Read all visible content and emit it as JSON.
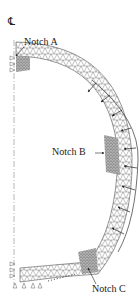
{
  "figure": {
    "centerline_symbol": "CL",
    "centerline_label": "℄",
    "labels": {
      "notch_a": "Notch A",
      "notch_b": "Notch B",
      "notch_c": "Notch C"
    },
    "elements": {
      "mesh": "triangular finite-element mesh of curved arch segment",
      "load": "distributed pressure arrows on outer radius",
      "supports": "roller supports along symmetry edges"
    },
    "colors": {
      "mesh_line": "#555555",
      "dense_mesh": "#777777",
      "text": "#222222",
      "background": "#ffffff"
    },
    "load_arrow_count": 9
  }
}
